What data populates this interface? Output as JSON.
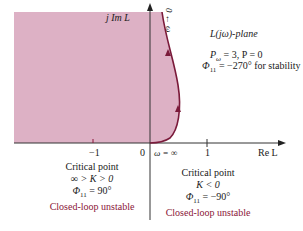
{
  "diagram": {
    "plane_title": "L(jω)-plane",
    "axes": {
      "imag_label": "j Im L",
      "real_label": "Re L",
      "origin_label": "0",
      "tick_minus_one": "−1",
      "tick_one": "1"
    },
    "curve_labels": {
      "omega_top": "0 ← ω",
      "omega_inf": "ω = ∞"
    },
    "conditions": {
      "line1": "P_ω = 3, P = 0",
      "line1_p": "P",
      "line1_sub": "ω",
      "line1_rest": " = 3, P = 0",
      "line2_phi": "Φ",
      "line2_sub": "11",
      "line2_rest": " = −270° for stability"
    },
    "left_block": {
      "title": "Critical point",
      "k_range": "∞ > K > 0",
      "phi": "Φ",
      "phi_sub": "11",
      "phi_rest": " = 90°",
      "verdict": "Closed-loop unstable"
    },
    "right_block": {
      "title": "Critical point",
      "k_range": "K < 0",
      "phi": "Φ",
      "phi_sub": "11",
      "phi_rest": " = −90°",
      "verdict": "Closed-loop unstable"
    },
    "colors": {
      "shade": "#d9a8bf",
      "curve": "#7a1a3a",
      "axis": "#333333",
      "verdict_text": "#8a1538"
    }
  }
}
